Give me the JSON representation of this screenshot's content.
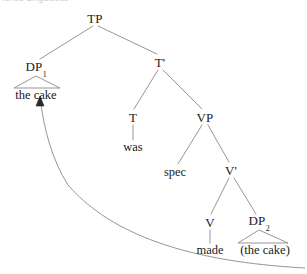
{
  "diagram": {
    "kind": "syntax-tree",
    "title_fragment_clipped": "Tense   Linguistics",
    "colors": {
      "line": "#8a8a8a",
      "text": "#1a1a1a",
      "background": "#ffffff",
      "arrow": "#8a8a8a"
    },
    "nodes": [
      {
        "id": "tp",
        "label": "TP",
        "sub": "",
        "x": 95,
        "y": 18,
        "type": "category"
      },
      {
        "id": "dp1",
        "label": "DP",
        "sub": "1",
        "x": 36,
        "y": 68,
        "type": "category"
      },
      {
        "id": "tbar",
        "label": "T'",
        "sub": "",
        "x": 160,
        "y": 62,
        "type": "category"
      },
      {
        "id": "thecake1",
        "label": "the cake",
        "sub": "",
        "x": 36,
        "y": 95,
        "type": "terminal"
      },
      {
        "id": "t",
        "label": "T",
        "sub": "",
        "x": 133,
        "y": 117,
        "type": "category"
      },
      {
        "id": "vp",
        "label": "VP",
        "sub": "",
        "x": 205,
        "y": 117,
        "type": "category"
      },
      {
        "id": "was",
        "label": "was",
        "sub": "",
        "x": 133,
        "y": 147,
        "type": "terminal"
      },
      {
        "id": "spec",
        "label": "spec",
        "sub": "",
        "x": 175,
        "y": 172,
        "type": "terminal"
      },
      {
        "id": "vbar",
        "label": "V'",
        "sub": "",
        "x": 231,
        "y": 170,
        "type": "category"
      },
      {
        "id": "v",
        "label": "V",
        "sub": "",
        "x": 210,
        "y": 222,
        "type": "category"
      },
      {
        "id": "dp2",
        "label": "DP",
        "sub": "2",
        "x": 259,
        "y": 222,
        "type": "category"
      },
      {
        "id": "made",
        "label": "made",
        "sub": "",
        "x": 210,
        "y": 250,
        "type": "terminal"
      },
      {
        "id": "thecake2",
        "label": "(the cake)",
        "sub": "",
        "x": 265,
        "y": 250,
        "type": "terminal"
      }
    ],
    "branches": [
      {
        "from": "tp",
        "to": "dp1",
        "x1": 93,
        "y1": 26,
        "x2": 40,
        "y2": 59
      },
      {
        "from": "tp",
        "to": "tbar",
        "x1": 98,
        "y1": 26,
        "x2": 157,
        "y2": 54
      },
      {
        "from": "tbar",
        "to": "t",
        "x1": 158,
        "y1": 70,
        "x2": 134,
        "y2": 109
      },
      {
        "from": "tbar",
        "to": "vp",
        "x1": 163,
        "y1": 70,
        "x2": 202,
        "y2": 109
      },
      {
        "from": "t",
        "to": "was",
        "x1": 133,
        "y1": 125,
        "x2": 133,
        "y2": 140
      },
      {
        "from": "vp",
        "to": "spec",
        "x1": 202,
        "y1": 125,
        "x2": 178,
        "y2": 164
      },
      {
        "from": "vp",
        "to": "vbar",
        "x1": 208,
        "y1": 125,
        "x2": 229,
        "y2": 162
      },
      {
        "from": "vbar",
        "to": "v",
        "x1": 229,
        "y1": 178,
        "x2": 211,
        "y2": 214
      },
      {
        "from": "vbar",
        "to": "dp2",
        "x1": 234,
        "y1": 178,
        "x2": 256,
        "y2": 214
      },
      {
        "from": "v",
        "to": "made",
        "x1": 210,
        "y1": 230,
        "x2": 210,
        "y2": 243
      }
    ],
    "triangles": [
      {
        "over": "the cake",
        "apex_x": 36,
        "apex_y": 76,
        "left_x": 14,
        "right_x": 60,
        "base_y": 88
      },
      {
        "over": "(the cake)",
        "apex_x": 259,
        "apex_y": 230,
        "left_x": 238,
        "right_x": 288,
        "base_y": 243
      }
    ],
    "movement_arrow": {
      "description": "curved movement arrow from trace DP2 up to DP1 the cake",
      "path": "M 305 268 C 215 263, 120 245, 68 185 C 52 160, 44 128, 41 104",
      "arrowhead": {
        "x": 40,
        "y": 97,
        "points": "40,96 36,106 44,106"
      }
    }
  }
}
